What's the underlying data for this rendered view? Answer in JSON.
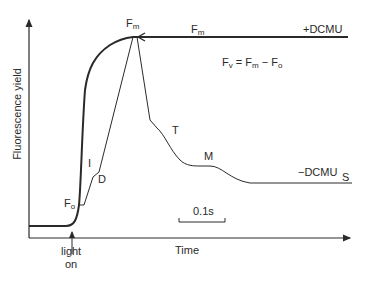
{
  "figure": {
    "y_axis_label": "Fluorescence yield",
    "x_axis_label": "Time",
    "light_on_label_line1": "light",
    "light_on_label_line2": "on",
    "equation": {
      "lhs": "F",
      "lhs_sub": "v",
      "eq": " = F",
      "m_sub": "m",
      "minus": " − F",
      "o_sub": "o"
    },
    "scale_bar_label": "0.1s",
    "curve_labels": {
      "plus_dcmu": "+DCMU",
      "minus_dcmu": "−DCMU",
      "fm_peak": "F",
      "fm_peak_sub": "m",
      "fm_plateau": "F",
      "fm_plateau_sub": "m",
      "fo": "F",
      "fo_sub": "o",
      "I": "I",
      "D": "D",
      "T": "T",
      "M": "M",
      "S": "S"
    },
    "colors": {
      "line": "#2a2a2a",
      "background": "#ffffff"
    }
  }
}
